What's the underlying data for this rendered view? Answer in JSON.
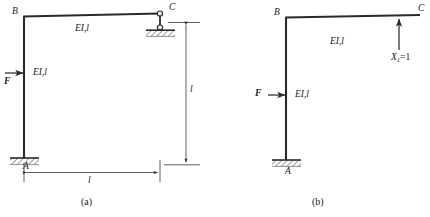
{
  "figure": {
    "title_caption_a": "(a)",
    "title_caption_b": "(b)",
    "colors": {
      "line": "#2a2a2a",
      "background": "#ffffff",
      "hatch": "#2a2a2a",
      "dimension": "#2a2a2a"
    }
  },
  "diagram_a": {
    "caption": "(a)",
    "nodes": {
      "a_label": "A",
      "b_label": "B",
      "c_label": "C"
    },
    "members": {
      "column_label": "EI,l",
      "beam_label": "EI,l"
    },
    "load": {
      "force_label": "F"
    },
    "support_a": "fixed-support",
    "support_c": "link-roller-support",
    "dimensions": {
      "horizontal_label": "l",
      "vertical_label": "l"
    }
  },
  "diagram_b": {
    "caption": "(b)",
    "nodes": {
      "a_label": "A",
      "b_label": "B",
      "c_label": "C"
    },
    "members": {
      "column_label": "EI,l",
      "beam_label": "EI,l"
    },
    "load": {
      "force_label": "F",
      "unit_force_symbol": "X",
      "unit_force_subscript": "1",
      "unit_force_value": "=1"
    },
    "support_a": "fixed-support"
  }
}
